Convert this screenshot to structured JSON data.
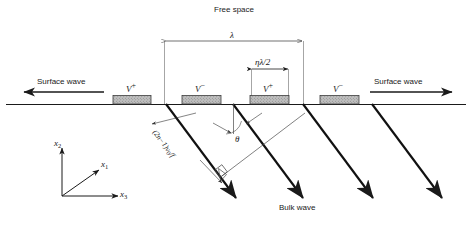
{
  "figure": {
    "title_top": "Free space",
    "medium_note": "substrate",
    "bulk_label": "Bulk wave",
    "surface_left": "Surface wave",
    "surface_right": "Surface wave",
    "angle_symbol": "θ",
    "period_symbol": "λ",
    "electrode_width_label": "ηλ/2",
    "wavefront_spacing": {
      "prefix": "(2n",
      "minus": "−",
      "mid": "1)",
      "v": "v",
      "v_sub": "0",
      "over": "/f"
    },
    "axes": {
      "x1": "x",
      "x1_sub": "1",
      "x2": "x",
      "x2_sub": "2",
      "x3": "x",
      "x3_sub": "3"
    },
    "electrodes": [
      {
        "name": "electrode-1",
        "polarity": "V",
        "sign": "+",
        "x": 113,
        "w": 38
      },
      {
        "name": "electrode-2",
        "polarity": "V",
        "sign": "−",
        "x": 182,
        "w": 39
      },
      {
        "name": "electrode-3",
        "polarity": "V",
        "sign": "+",
        "x": 250,
        "w": 39
      },
      {
        "name": "electrode-4",
        "polarity": "V",
        "sign": "−",
        "x": 320,
        "w": 39
      }
    ],
    "colors": {
      "line": "#1a1a1a",
      "ray": "#111111",
      "electrode_fill": "#b8b8b8",
      "electrode_edge": "#444444",
      "thin": "#555555",
      "background": "#ffffff"
    },
    "geometry": {
      "surface_y": 104,
      "lambda_left_x": 164,
      "lambda_right_x": 303,
      "eta_left_x": 251,
      "eta_right_x": 288,
      "dim_y_lambda": 41,
      "dim_y_eta": 69
    }
  }
}
